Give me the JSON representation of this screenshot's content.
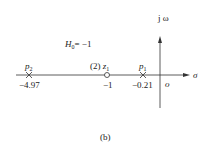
{
  "diagram": {
    "type": "pole-zero plot (s-plane)",
    "axes": {
      "vertical_label": "j ω",
      "horizontal_label": "σ",
      "origin_label": "o"
    },
    "gain": {
      "symbol": "H",
      "subscript": "0",
      "eq": "= −1"
    },
    "poles": [
      {
        "name": "p",
        "sub": "2",
        "value_label": "−4.97"
      },
      {
        "name": "p",
        "sub": "1",
        "value_label": "−0.21"
      }
    ],
    "zeros": [
      {
        "order_label": "(2)",
        "name": "z",
        "sub": "1",
        "value_label": "−1"
      }
    ],
    "caption": "(b)"
  }
}
